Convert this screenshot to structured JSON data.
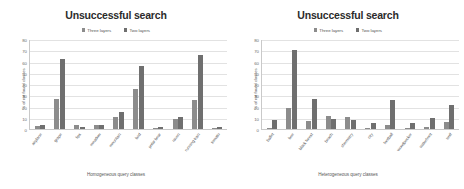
{
  "figure": {
    "legend_labels": [
      "Three layers",
      "Two layers"
    ],
    "colors": {
      "three_layers": "#8c8c8c",
      "two_layers": "#6f6f6f",
      "grid": "#e2e2e2",
      "axis": "#c9c9c9",
      "background": "#ffffff",
      "text": "#5a5a5a"
    }
  },
  "charts": [
    {
      "title": "Unsuccessful search",
      "ylabel": "% of not found classes",
      "xlabel": "Homogeneous query classes",
      "ylim": [
        0,
        80
      ],
      "yticks": [
        0,
        10,
        20,
        30,
        40,
        50,
        60,
        70,
        80
      ]
    },
    {
      "title": "Unsuccessful search",
      "ylabel": "% of not found classes",
      "xlabel": "Heterogeneous query classes",
      "ylim": [
        0,
        80
      ],
      "yticks": [
        0,
        10,
        20,
        30,
        40,
        50,
        60,
        70,
        80
      ]
    }
  ],
  "chart_data": [
    {
      "type": "bar",
      "title": "Unsuccessful search",
      "xlabel": "Homogeneous query classes",
      "ylabel": "% of not found classes",
      "ylim": [
        0,
        80
      ],
      "yticks": [
        0,
        10,
        20,
        30,
        40,
        50,
        60,
        70,
        80
      ],
      "grid": true,
      "legend_position": "top",
      "categories": [
        "airplane",
        "grape",
        "lips",
        "meadow",
        "mountain",
        "bird",
        "polar bear",
        "raven",
        "running train",
        "tomato"
      ],
      "series": [
        {
          "name": "Three layers",
          "values": [
            3,
            27,
            4,
            4,
            11,
            36,
            0,
            9,
            26,
            0
          ]
        },
        {
          "name": "Two layers",
          "values": [
            4,
            62,
            2,
            4,
            15,
            56,
            2,
            11,
            66,
            2
          ]
        }
      ]
    },
    {
      "type": "bar",
      "title": "Unsuccessful search",
      "xlabel": "Heterogeneous query classes",
      "ylabel": "% of not found classes",
      "ylim": [
        0,
        80
      ],
      "yticks": [
        0,
        10,
        20,
        30,
        40,
        50,
        60,
        70,
        80
      ],
      "grid": true,
      "legend_position": "top",
      "categories": [
        "ballet",
        "bee",
        "black forest",
        "beach",
        "chemistry",
        "city",
        "football",
        "woodpecker",
        "waterfront",
        "wolf"
      ],
      "series": [
        {
          "name": "Three layers",
          "values": [
            0,
            19,
            7,
            12,
            11,
            0,
            4,
            1,
            2,
            6
          ]
        },
        {
          "name": "Two layers",
          "values": [
            8,
            70,
            27,
            9,
            8,
            5,
            26,
            5,
            10,
            21
          ]
        }
      ]
    }
  ]
}
